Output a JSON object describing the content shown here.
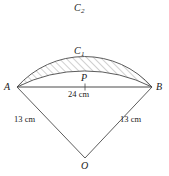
{
  "figure": {
    "points": {
      "A": "A",
      "B": "B",
      "P": "P",
      "O": "O"
    },
    "arcs": {
      "outer": "C",
      "outer_sub": "2",
      "inner": "C",
      "inner_sub": "1"
    },
    "dimensions": {
      "chord": "24 cm",
      "left_radius": "13 cm",
      "right_radius": "13 cm"
    },
    "colors": {
      "stroke": "#4a4a4a",
      "hatch": "#8a8a8a",
      "label": "#1a1a1a",
      "background": "#ffffff"
    },
    "geometry": {
      "A_x": 17,
      "A_y": 87,
      "B_x": 152,
      "B_y": 87,
      "P_x": 85,
      "P_y": 87,
      "O_x": 85,
      "O_y": 158,
      "outer_apex_y": 20,
      "inner_apex_y": 64
    }
  }
}
